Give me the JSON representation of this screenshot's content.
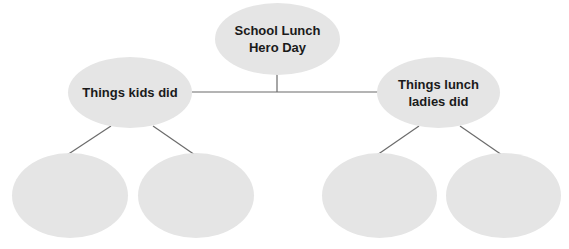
{
  "diagram": {
    "type": "tree",
    "colors": {
      "node_fill": "#e5e5e5",
      "connector": "#6b6b6b",
      "text": "#1a1a1a",
      "background": "#ffffff"
    },
    "root": {
      "label": "School Lunch\nHero Day"
    },
    "branches": [
      {
        "label": "Things kids did",
        "children": [
          {
            "label": ""
          },
          {
            "label": ""
          }
        ]
      },
      {
        "label": "Things lunch\nladies did",
        "children": [
          {
            "label": ""
          },
          {
            "label": ""
          }
        ]
      }
    ]
  }
}
